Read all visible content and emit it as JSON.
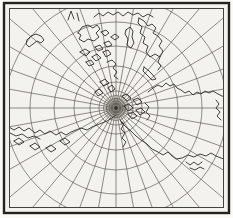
{
  "figure": {
    "kind": "scanned-map-figure",
    "page_color": "#fbfaf7",
    "paper_color": "#f4f2ee",
    "frame": {
      "outer": {
        "x": 4,
        "y": 3,
        "w": 225,
        "h": 210,
        "color": "#24231f",
        "width": 2.4
      },
      "inner": {
        "x": 9,
        "y": 8,
        "w": 215,
        "h": 200,
        "color": "#45433e",
        "width": 1
      }
    },
    "graticule": {
      "center": {
        "x": 116,
        "y": 108
      },
      "meridian_count": 36,
      "meridian_interval_deg": 10,
      "meridian_inner_radius": 3,
      "meridian_outer_radius": 170,
      "parallel_radii": [
        2.5,
        4.5,
        7,
        9.5,
        12.5,
        17,
        26,
        42,
        62,
        86,
        111
      ],
      "color": "#55524c",
      "stroke_width": 0.65
    },
    "pole": {
      "halo_radius": 11,
      "halo_color": "#cfccc5",
      "mid_radius": 6,
      "mid_color": "#b2afa8",
      "dot_radius": 2,
      "dot_color": "#34322d"
    },
    "coastlines": {
      "color": "#2e2d29",
      "stroke_width": 0.9,
      "paths": [
        {
          "name": "top-stroke-a",
          "points": "68,20 71,11 74,19"
        },
        {
          "name": "top-stroke-b",
          "points": "77,13 79,21"
        },
        {
          "name": "arctic-north-coast",
          "points": "94,17 99,13 103,16 108,12 113,15 118,12 123,16 128,12 133,15 138,13 143,17 148,14 153,17"
        },
        {
          "name": "western-arctic-island",
          "points": "78,33 82,27 88,25 93,28 97,25 100,29 96,33 99,37 94,41 88,39 84,42 79,39 81,35 78,33"
        },
        {
          "name": "arctic-islet-1",
          "points": "101,32 106,30 109,33 105,36 101,32"
        },
        {
          "name": "arctic-islet-2",
          "points": "111,37 115,34 119,37 115,40 111,37"
        },
        {
          "name": "arctic-islet-3",
          "points": "104,43 109,41 112,45 107,47 104,43"
        },
        {
          "name": "arctic-islet-4",
          "points": "95,47 100,45 103,49 98,51 95,47"
        },
        {
          "name": "strip-island",
          "points": "126,30 130,27 133,31 132,37 134,43 131,48 127,45 128,39 125,34 126,30"
        },
        {
          "name": "greenland-mass",
          "points": "139,18 144,21 148,26 152,24 156,28 153,33 158,36 162,41 159,46 163,51 160,57 155,54 150,57 146,52 148,46 143,43 145,37 140,33 142,27 138,23 139,18"
        },
        {
          "name": "greenland-tail",
          "points": "160,57 158,62 161,66 158,70"
        },
        {
          "name": "lower-island-row-1",
          "points": "80,52 85,49 90,52 86,56 80,52"
        },
        {
          "name": "lower-island-row-2",
          "points": "92,57 97,54 101,58 96,61 92,57"
        },
        {
          "name": "lower-island-row-3",
          "points": "103,52 108,50 111,54 106,57 103,52"
        },
        {
          "name": "lower-island-row-4",
          "points": "86,62 91,60 94,64 89,66 86,62"
        },
        {
          "name": "coast-toward-pole",
          "points": "107,62 112,60 116,64 113,68 117,72 114,76 118,79"
        },
        {
          "name": "svalbard-island",
          "points": "144,67 148,70 152,74 156,79 152,80 147,75 143,71 144,67"
        },
        {
          "name": "siberia-north-coast",
          "points": "148,92 153,88 158,85 162,87 166,83 170,86 174,84 177,88 181,90 185,93 189,91 193,95 197,92 201,94 205,91 209,93 213,91 218,94 222,96 227,98 231,97"
        },
        {
          "name": "river-squiggle-1",
          "points": "216,100 219,104 216,108 220,112 217,116 221,120"
        },
        {
          "name": "river-squiggle-2",
          "points": "224,103 227,108 225,113 228,118 226,123"
        },
        {
          "name": "near-pole-blob-1",
          "points": "122,96 127,94 131,98 127,101 122,96"
        },
        {
          "name": "near-pole-blob-2",
          "points": "133,100 138,98 142,102 137,105 133,100"
        },
        {
          "name": "near-pole-blob-3",
          "points": "124,106 129,104 133,108 128,111 124,106"
        },
        {
          "name": "near-pole-blob-4",
          "points": "136,110 141,108 145,112 140,115 136,110"
        },
        {
          "name": "near-pole-blob-5",
          "points": "128,114 133,112 137,116 132,119 128,114"
        },
        {
          "name": "near-pole-squiggle",
          "points": "145,103 149,107 146,112 150,116 147,120"
        },
        {
          "name": "pole-west-islet-1",
          "points": "108,88 112,85 115,89 111,92 108,88"
        },
        {
          "name": "pole-west-islet-2",
          "points": "100,82 105,79 109,83 104,86 100,82"
        },
        {
          "name": "pole-west-islet-3",
          "points": "95,92 99,89 103,93 98,96 95,92"
        },
        {
          "name": "coast-below-pole",
          "points": "120,120 124,124 121,129 125,133 122,138 126,142 123,147"
        },
        {
          "name": "asia-southeast-coast",
          "points": "121,122 126,127 131,131 136,136 141,140 147,144 152,149 158,152 163,155 168,152 172,156 176,159 182,158 188,155 194,157 200,154 206,156 211,153 216,156 221,158 227,160 231,162"
        },
        {
          "name": "asia-coast-squiggle-1",
          "points": "186,162 190,165 194,162 198,165 202,162"
        },
        {
          "name": "asia-coast-squiggle-2",
          "points": "190,168 195,170 200,167 204,169"
        },
        {
          "name": "aleutian-chain",
          "points": "9,127 14,130 19,127 24,131 29,128 35,133 40,130 45,134 50,131 56,135 61,132 66,135 71,132 76,130 81,128 87,130 92,127 97,125 102,123 107,121 112,118 116,115"
        },
        {
          "name": "aleutian-parallel-shore",
          "points": "10,133 16,136 22,134 28,138 34,136 40,139"
        },
        {
          "name": "aleutian-islet-1",
          "points": "14,141 19,138 24,142 19,145 14,141"
        },
        {
          "name": "aleutian-islet-2",
          "points": "30,146 35,143 40,147 35,150 30,146"
        },
        {
          "name": "aleutian-islet-3",
          "points": "46,148 51,145 56,149 51,152 46,148"
        },
        {
          "name": "aleutian-islet-4",
          "points": "60,141 65,138 70,142 65,145 60,141"
        },
        {
          "name": "northwest-hook",
          "points": "27,40 31,36 36,34 41,36 44,40 41,43 37,41 33,44 29,47 26,44 27,40"
        }
      ]
    }
  }
}
